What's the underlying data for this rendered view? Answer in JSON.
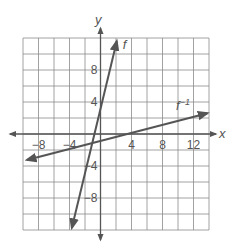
{
  "chart_data": {
    "type": "line",
    "title": "",
    "xlabel": "x",
    "ylabel": "y",
    "xlim": [
      -10,
      14
    ],
    "ylim": [
      -12,
      12
    ],
    "grid": true,
    "grid_step": 2,
    "x_ticks": [
      {
        "value": -8,
        "label": "−8"
      },
      {
        "value": -4,
        "label": "−4"
      },
      {
        "value": 4,
        "label": "4"
      },
      {
        "value": 8,
        "label": "8"
      },
      {
        "value": 12,
        "label": "12"
      }
    ],
    "y_ticks": [
      {
        "value": 8,
        "label": "8"
      },
      {
        "value": 4,
        "label": "4"
      },
      {
        "value": -4,
        "label": "−4"
      },
      {
        "value": -8,
        "label": "−8"
      }
    ],
    "series": [
      {
        "name": "f",
        "label": "f",
        "equation": "y = 4x + 3",
        "points": [
          [
            -3.7,
            -11.75
          ],
          [
            2.1,
            11.6
          ]
        ]
      },
      {
        "name": "f_inverse",
        "label": "f",
        "label_sup": "−1",
        "equation": "y = (x − 3)/4",
        "points": [
          [
            -9.5,
            -3.25
          ],
          [
            13.8,
            2.6
          ]
        ]
      }
    ]
  },
  "colors": {
    "grid": "#8a8a8a",
    "axis": "#555555",
    "line": "#555555"
  }
}
